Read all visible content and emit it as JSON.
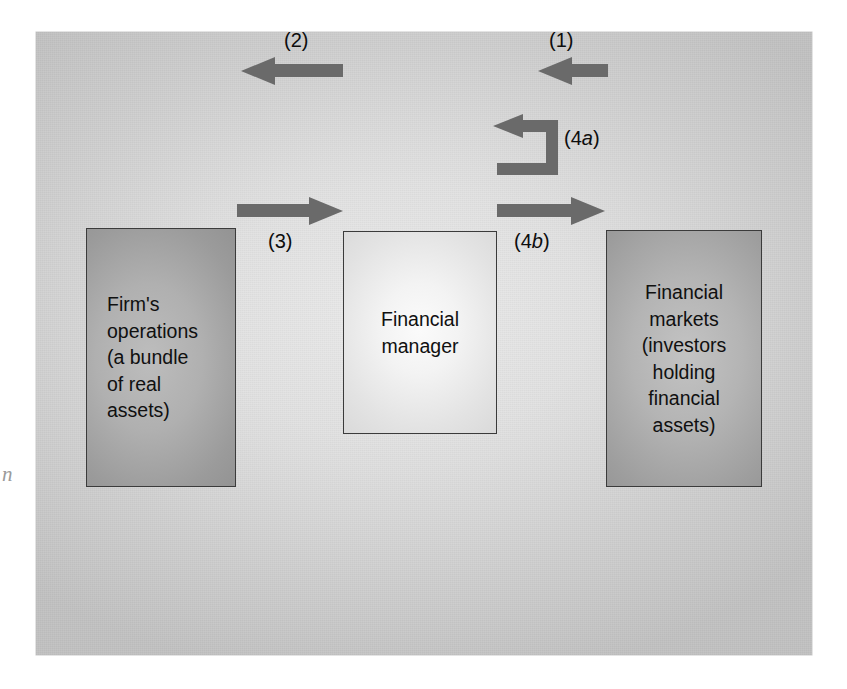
{
  "figure": {
    "background_color": "#d8d8d8",
    "arrow_color": "#6a6a6a",
    "margin_mark": "n"
  },
  "nodes": {
    "firm": {
      "name": "firm-operations",
      "lines": [
        "Firm's",
        "operations",
        "(a bundle",
        "of real",
        "assets)"
      ],
      "text": "Firm's operations (a bundle of real assets)",
      "fill": "#a8a8a8",
      "align": "left"
    },
    "manager": {
      "name": "financial-manager",
      "lines": [
        "Financial",
        "manager"
      ],
      "text": "Financial manager",
      "fill": "#efefef",
      "align": "center"
    },
    "markets": {
      "name": "financial-markets",
      "lines": [
        "Financial",
        "markets",
        "(investors",
        "holding",
        "financial",
        "assets)"
      ],
      "text": "Financial markets (investors holding financial assets)",
      "fill": "#ababab",
      "align": "center"
    }
  },
  "flows": [
    {
      "id": "1",
      "label": "(1)",
      "label_plain": "1",
      "from": "financial-markets",
      "to": "financial-manager",
      "direction": "left"
    },
    {
      "id": "2",
      "label": "(2)",
      "label_plain": "2",
      "from": "financial-manager",
      "to": "firm-operations",
      "direction": "left"
    },
    {
      "id": "3",
      "label": "(3)",
      "label_plain": "3",
      "from": "firm-operations",
      "to": "financial-manager",
      "direction": "right"
    },
    {
      "id": "4a",
      "label_prefix": "(4",
      "label_italic": "a",
      "label_suffix": ")",
      "label": "(4a)",
      "from": "financial-manager",
      "to": "financial-manager",
      "direction": "loop-back-left"
    },
    {
      "id": "4b",
      "label_prefix": "(4",
      "label_italic": "b",
      "label_suffix": ")",
      "label": "(4b)",
      "from": "financial-manager",
      "to": "financial-markets",
      "direction": "right"
    }
  ]
}
